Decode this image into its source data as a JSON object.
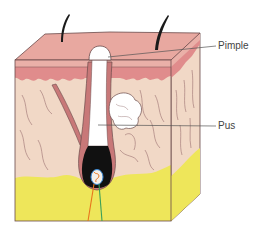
{
  "diagram": {
    "labels": [
      {
        "id": "pimple",
        "text": "Pimple",
        "x": 218,
        "y": 41,
        "line": {
          "x1": 110,
          "y1": 57,
          "x2": 217,
          "y2": 46
        }
      },
      {
        "id": "pus",
        "text": "Pus",
        "x": 218,
        "y": 121,
        "line": {
          "x1": 100,
          "y1": 125,
          "x2": 217,
          "y2": 126
        }
      }
    ],
    "colors": {
      "skin_top": "#e8a8a0",
      "epidermis": "#eab0a8",
      "epidermis_dark": "#e08c8c",
      "dermis": "#f1d8c6",
      "fat": "#eee65a",
      "outline": "#6a4a4a",
      "hair": "#1a1a1a",
      "pus": "#ffffff",
      "bulb": "#111111",
      "nerve_orange": "#e8741c",
      "nerve_green": "#3aa05a",
      "nerve_blue": "#3a8ad8"
    }
  }
}
